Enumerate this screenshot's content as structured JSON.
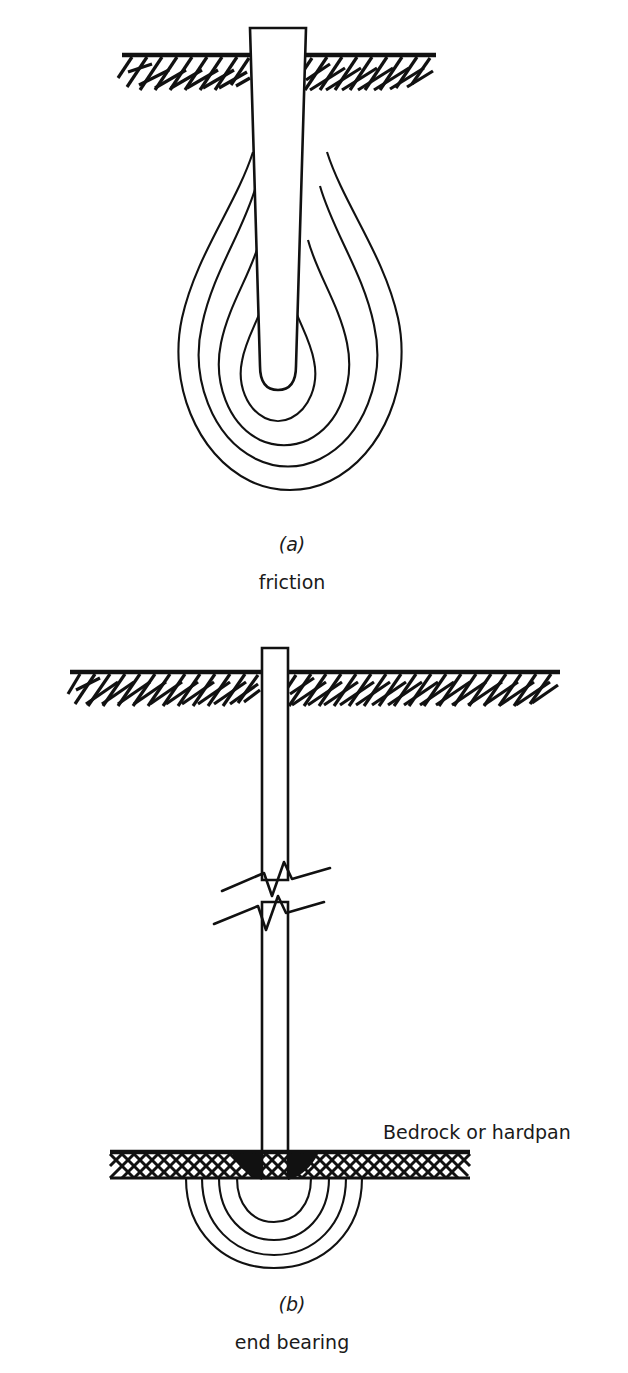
{
  "figure": {
    "background_color": "#ffffff",
    "ink_color": "#111111",
    "width": 628,
    "height": 1373
  },
  "panels": [
    {
      "id": "a",
      "letter": "(a)",
      "name": "friction",
      "pile_type": "tapered friction pile",
      "ground_surface_label": "",
      "stress_bulb_count": 4,
      "stress_bulb_shape": "teardrop",
      "pile": {
        "top_width_px": 56,
        "tip_width_px": 22,
        "top_y_px": 28,
        "tip_y_px": 392,
        "tapered": true
      },
      "ground": {
        "line_y_px": 55,
        "left_x_px": 122,
        "right_x_px": 436,
        "hatch_style": "diagonal-dashes"
      }
    },
    {
      "id": "b",
      "letter": "(b)",
      "name": "end bearing",
      "pile_type": "straight end bearing pile",
      "ground_surface_label": "Bedrock or hardpan",
      "stress_bulb_count": 4,
      "stress_bulb_shape": "circular",
      "pile": {
        "top_width_px": 26,
        "tip_width_px": 26,
        "top_y_px": 648,
        "tip_y_px": 1178,
        "tapered": false,
        "break_symbol": true
      },
      "ground": {
        "line_y_px": 672,
        "left_x_px": 70,
        "right_x_px": 560,
        "hatch_style": "diagonal-dashes"
      },
      "bedrock": {
        "line_y_px": 1152,
        "left_x_px": 110,
        "right_x_px": 470,
        "band_height_px": 26,
        "hatch_style": "cross-hatch"
      }
    }
  ],
  "labels": {
    "panel_a_letter": "(a)",
    "panel_a_name": "friction",
    "panel_b_letter": "(b)",
    "panel_b_name": "end bearing",
    "bedrock_label": "Bedrock or hardpan"
  }
}
